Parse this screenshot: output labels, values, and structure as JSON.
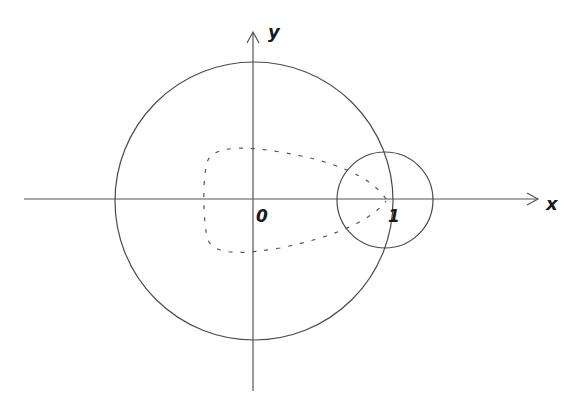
{
  "diagram": {
    "axes": {
      "x_label": "x",
      "y_label": "y",
      "origin_label": "0",
      "unit_label": "1"
    },
    "shapes": [
      {
        "name": "large-circle",
        "center": [
          0,
          0
        ],
        "radius_units": 1.05,
        "style": "solid"
      },
      {
        "name": "small-circle",
        "center": [
          1,
          0
        ],
        "radius_units": 0.36,
        "style": "solid"
      },
      {
        "name": "dashed-contour",
        "style": "dashed",
        "description": "closed curve around origin converging to point 1"
      }
    ],
    "colors": {
      "stroke": "#4a4a4a",
      "label": "#1a1a1a",
      "background": "#ffffff"
    }
  }
}
